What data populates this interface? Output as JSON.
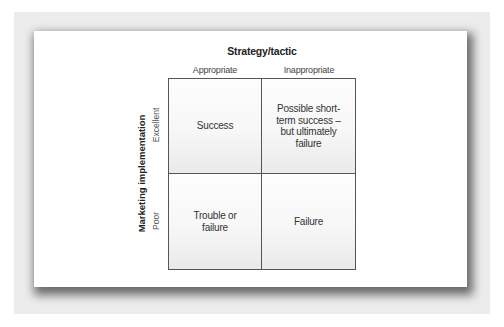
{
  "diagram": {
    "title": "Strategy/tactic",
    "columns": [
      "Appropriate",
      "Inappropriate"
    ],
    "y_axis_label": "Marketing implementation",
    "rows": [
      "Excellent",
      "Poor"
    ],
    "cells": [
      [
        "Success",
        "Possible short-term success – but ultimately failure"
      ],
      [
        "Trouble or failure",
        "Failure"
      ]
    ]
  }
}
